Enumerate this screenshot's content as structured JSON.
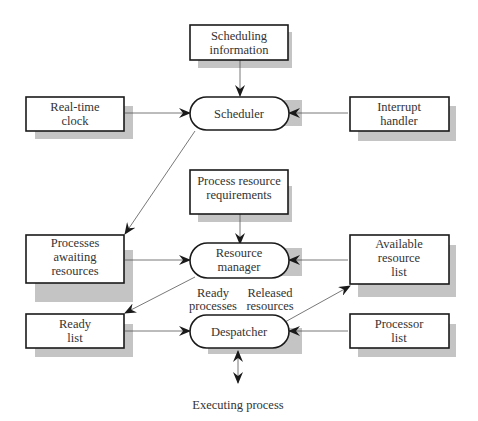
{
  "diagram": {
    "nodes": {
      "scheduling_info": {
        "line1": "Scheduling",
        "line2": "information"
      },
      "scheduler": {
        "label": "Scheduler"
      },
      "realtime_clock": {
        "line1": "Real-time",
        "line2": "clock"
      },
      "interrupt_handler": {
        "line1": "Interrupt",
        "line2": "handler"
      },
      "process_req": {
        "line1": "Process resource",
        "line2": "requirements"
      },
      "resource_manager": {
        "line1": "Resource",
        "line2": "manager"
      },
      "processes_awaiting": {
        "line1": "Processes",
        "line2": "awaiting",
        "line3": "resources"
      },
      "available_resource": {
        "line1": "Available",
        "line2": "resource",
        "line3": "list"
      },
      "ready_list": {
        "line1": "Ready",
        "line2": "list"
      },
      "despatcher": {
        "label": "Despatcher"
      },
      "processor_list": {
        "line1": "Processor",
        "line2": "list"
      },
      "executing_process": {
        "label": "Executing process"
      }
    },
    "edge_labels": {
      "ready_processes": {
        "line1": "Ready",
        "line2": "processes"
      },
      "released_resources": {
        "line1": "Released",
        "line2": "resources"
      }
    },
    "edges": [
      {
        "from": "Scheduling information",
        "to": "Scheduler"
      },
      {
        "from": "Real-time clock",
        "to": "Scheduler"
      },
      {
        "from": "Interrupt handler",
        "to": "Scheduler"
      },
      {
        "from": "Scheduler",
        "to": "Processes awaiting resources"
      },
      {
        "from": "Process resource requirements",
        "to": "Resource manager"
      },
      {
        "from": "Processes awaiting resources",
        "to": "Resource manager"
      },
      {
        "from": "Available resource list",
        "to": "Resource manager"
      },
      {
        "from": "Resource manager",
        "to": "Ready list",
        "label": "Ready processes"
      },
      {
        "from": "Ready list",
        "to": "Despatcher"
      },
      {
        "from": "Processor list",
        "to": "Despatcher"
      },
      {
        "from": "Despatcher",
        "to": "Available resource list",
        "label": "Released resources"
      },
      {
        "from": "Despatcher",
        "to": "Executing process",
        "bidirectional": true
      }
    ]
  }
}
